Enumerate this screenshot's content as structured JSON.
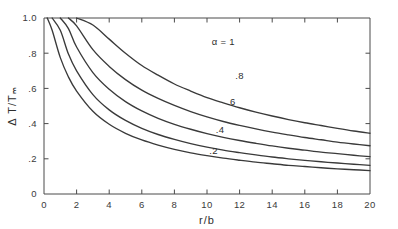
{
  "chart_data": {
    "type": "line",
    "title": "",
    "xlabel": "r/b",
    "ylabel": "Δ T/Tₘ",
    "xlim": [
      0,
      20
    ],
    "ylim": [
      0,
      1.0
    ],
    "grid": false,
    "legend_position": "inline-curve-labels",
    "xticks": [
      0,
      2,
      4,
      6,
      8,
      10,
      12,
      14,
      16,
      18,
      20
    ],
    "xticklabels": [
      "0",
      "2",
      "4",
      "6",
      "8",
      "10",
      "12",
      "14",
      "16",
      "18",
      "20"
    ],
    "yticks": [
      0,
      0.2,
      0.4,
      0.6,
      0.8,
      1.0
    ],
    "yticklabels": [
      "0",
      ".2",
      ".4",
      ".6",
      ".8",
      "1.0"
    ],
    "x": [
      0.2,
      0.5,
      1,
      1.5,
      2,
      3,
      4,
      5,
      6,
      7,
      8,
      9,
      10,
      11,
      12,
      13,
      14,
      15,
      16,
      17,
      18,
      19,
      20
    ],
    "series": [
      {
        "name": "alpha = 1",
        "label": "α = 1",
        "label_x": 11.0,
        "label_y": 0.845,
        "values": [
          1.0,
          1.0,
          1.0,
          1.0,
          1.0,
          0.96,
          0.88,
          0.8,
          0.73,
          0.675,
          0.625,
          0.585,
          0.548,
          0.518,
          0.49,
          0.465,
          0.443,
          0.423,
          0.405,
          0.389,
          0.373,
          0.358,
          0.345
        ]
      },
      {
        "name": "alpha = .8",
        "label": ".8",
        "label_x": 12.0,
        "label_y": 0.655,
        "values": [
          1.0,
          1.0,
          1.0,
          1.0,
          0.955,
          0.82,
          0.725,
          0.65,
          0.59,
          0.543,
          0.503,
          0.468,
          0.438,
          0.412,
          0.39,
          0.37,
          0.352,
          0.336,
          0.321,
          0.308,
          0.295,
          0.284,
          0.274
        ]
      },
      {
        "name": "alpha = .6",
        "label": ".6",
        "label_x": 11.5,
        "label_y": 0.505,
        "values": [
          1.0,
          1.0,
          1.0,
          0.94,
          0.835,
          0.69,
          0.595,
          0.525,
          0.472,
          0.43,
          0.396,
          0.368,
          0.343,
          0.322,
          0.304,
          0.288,
          0.273,
          0.26,
          0.249,
          0.238,
          0.229,
          0.22,
          0.212
        ]
      },
      {
        "name": "alpha = .4",
        "label": ".4",
        "label_x": 10.8,
        "label_y": 0.345,
        "values": [
          1.0,
          1.0,
          0.93,
          0.795,
          0.7,
          0.565,
          0.478,
          0.418,
          0.373,
          0.338,
          0.31,
          0.286,
          0.266,
          0.249,
          0.235,
          0.222,
          0.21,
          0.2,
          0.191,
          0.183,
          0.176,
          0.169,
          0.163
        ]
      },
      {
        "name": "alpha = .2",
        "label": ".2",
        "label_x": 10.4,
        "label_y": 0.225,
        "values": [
          1.0,
          0.93,
          0.775,
          0.665,
          0.585,
          0.47,
          0.396,
          0.345,
          0.307,
          0.278,
          0.254,
          0.234,
          0.218,
          0.204,
          0.192,
          0.181,
          0.172,
          0.163,
          0.156,
          0.149,
          0.143,
          0.138,
          0.133
        ]
      }
    ]
  },
  "plot": {
    "frame_color": "#4a4a4a",
    "curve_color": "#3a3a3a",
    "background": "#ffffff"
  }
}
